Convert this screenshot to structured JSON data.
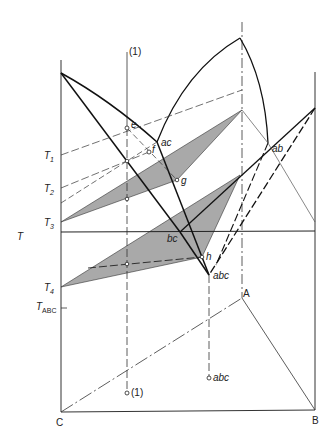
{
  "diagram": {
    "type": "ternary-eutectic-phase-diagram-projection",
    "axis_label": "T",
    "temperature_labels": {
      "t1": "T",
      "t1_sub": "1",
      "t2": "T",
      "t2_sub": "2",
      "t3": "T",
      "t3_sub": "3",
      "t4": "T",
      "t4_sub": "4",
      "tabc": "T",
      "tabc_sub": "ABC"
    },
    "vertex_labels": {
      "c": "C",
      "b": "B",
      "a": "A"
    },
    "point_labels": {
      "line1_top": "(1)",
      "line1_bottom": "(1)",
      "e": "e",
      "f": "f",
      "g": "g",
      "h": "h",
      "ac": "ac",
      "ab": "ab",
      "bc": "bc",
      "abc": "abc",
      "abc_base": "abc"
    },
    "colors": {
      "line": "#1a1a1a",
      "shade": "#a9a9a9",
      "background": "#ffffff"
    }
  }
}
